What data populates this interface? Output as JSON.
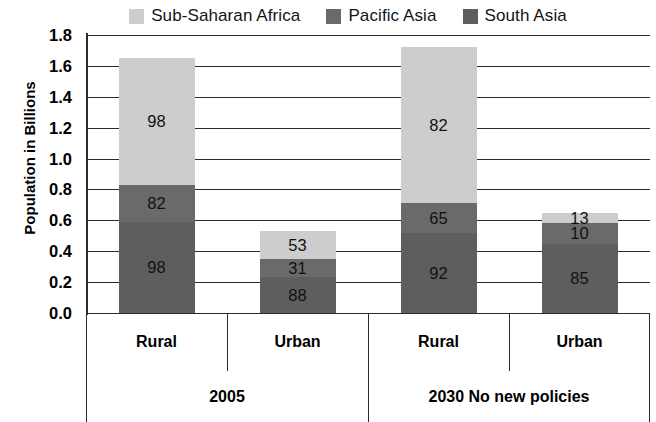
{
  "chart_data": {
    "type": "bar",
    "stacked": true,
    "title": "",
    "xlabel": "",
    "ylabel": "Population in Billions",
    "ylim": [
      0.0,
      1.8
    ],
    "ytick_labels": [
      "1.8",
      "1.6",
      "1.4",
      "1.2",
      "1.0",
      "0.8",
      "0.6",
      "0.4",
      "0.2",
      "0.0"
    ],
    "ytick_values": [
      1.8,
      1.6,
      1.4,
      1.2,
      1.0,
      0.8,
      0.6,
      0.4,
      0.2,
      0.0
    ],
    "grid": true,
    "legend_position": "top",
    "categories": [
      "Rural",
      "Urban",
      "Rural",
      "Urban"
    ],
    "groups": [
      {
        "label": "2005",
        "categories": [
          "Rural",
          "Urban"
        ]
      },
      {
        "label": "2030 No new policies",
        "categories": [
          "Rural",
          "Urban"
        ]
      }
    ],
    "series": [
      {
        "name": "Sub-Saharan Africa",
        "color": "#cdcdcd",
        "values": [
          0.98,
          0.53,
          0.82,
          0.13
        ],
        "labels": [
          "98",
          "53",
          "82",
          "13"
        ]
      },
      {
        "name": "Pacific Asia",
        "color": "#6a6a6a",
        "values": [
          0.82,
          0.31,
          0.65,
          0.1
        ],
        "labels": [
          "82",
          "31",
          "65",
          "10"
        ]
      },
      {
        "name": "South Asia",
        "color": "#5e5e5e",
        "values": [
          0.98,
          0.88,
          0.92,
          0.85
        ],
        "labels": [
          "98",
          "88",
          "92",
          "85"
        ]
      }
    ],
    "bar_totals": [
      1.65,
      0.53,
      1.72,
      0.65
    ],
    "stack_order_bottom_to_top": [
      "South Asia",
      "Pacific Asia",
      "Sub-Saharan Africa"
    ],
    "bars": [
      {
        "category": "Rural",
        "group": "2005",
        "total": 1.65,
        "segments": [
          {
            "series": "South Asia",
            "label": "98",
            "height": 0.59
          },
          {
            "series": "Pacific Asia",
            "label": "82",
            "height": 0.24
          },
          {
            "series": "Sub-Saharan Africa",
            "label": "98",
            "height": 0.82
          }
        ]
      },
      {
        "category": "Urban",
        "group": "2005",
        "total": 0.53,
        "segments": [
          {
            "series": "South Asia",
            "label": "88",
            "height": 0.23
          },
          {
            "series": "Pacific Asia",
            "label": "31",
            "height": 0.12
          },
          {
            "series": "Sub-Saharan Africa",
            "label": "53",
            "height": 0.18
          }
        ]
      },
      {
        "category": "Rural",
        "group": "2030 No new policies",
        "total": 1.72,
        "segments": [
          {
            "series": "South Asia",
            "label": "92",
            "height": 0.52
          },
          {
            "series": "Pacific Asia",
            "label": "65",
            "height": 0.19
          },
          {
            "series": "Sub-Saharan Africa",
            "label": "82",
            "height": 1.01
          }
        ]
      },
      {
        "category": "Urban",
        "group": "2030 No new policies",
        "total": 0.65,
        "segments": [
          {
            "series": "South Asia",
            "label": "85",
            "height": 0.45
          },
          {
            "series": "Pacific Asia",
            "label": "10",
            "height": 0.13
          },
          {
            "series": "Sub-Saharan Africa",
            "label": "13",
            "height": 0.07
          }
        ]
      }
    ]
  },
  "legend": {
    "items": [
      {
        "label": "Sub-Saharan Africa",
        "color": "#cdcdcd"
      },
      {
        "label": "Pacific Asia",
        "color": "#6a6a6a"
      },
      {
        "label": "South Asia",
        "color": "#5e5e5e"
      }
    ]
  },
  "axis": {
    "y_title": "Population in Billions"
  }
}
